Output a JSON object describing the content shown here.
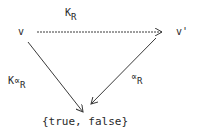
{
  "diagram": {
    "type": "commutative-diagram",
    "nodes": {
      "v": {
        "label": "v"
      },
      "v_prime": {
        "label": "v'"
      },
      "bool": {
        "label": "{true, false}"
      }
    },
    "edges": {
      "top": {
        "from": "v",
        "to": "v_prime",
        "label_main": "K",
        "label_sub": "R"
      },
      "left": {
        "from": "v",
        "to": "bool",
        "label_main": "K∝",
        "label_sub": "R"
      },
      "right": {
        "from": "v_prime",
        "to": "bool",
        "label_main": "∝",
        "label_sub": "R"
      }
    },
    "colors": {
      "line": "#3a3a3a",
      "text": "#2a2a2a",
      "background": "#ffffff"
    }
  }
}
